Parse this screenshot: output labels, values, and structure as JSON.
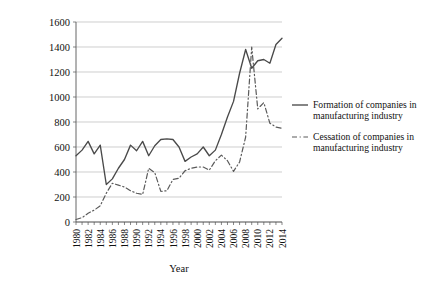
{
  "chart_data": {
    "type": "line",
    "title": "",
    "xlabel": "Year",
    "ylabel": "",
    "xlim": [
      1980,
      2014
    ],
    "ylim": [
      0,
      1600
    ],
    "ytick_step": 200,
    "xtick_step": 2,
    "grid": true,
    "legend_position": "right",
    "yticks": [
      0,
      200,
      400,
      600,
      800,
      1000,
      1200,
      1400,
      1600
    ],
    "xticks": [
      1980,
      1982,
      1984,
      1986,
      1988,
      1990,
      1992,
      1994,
      1996,
      1998,
      2000,
      2002,
      2004,
      2006,
      2008,
      2010,
      2012,
      2014
    ],
    "x": [
      1980,
      1981,
      1982,
      1983,
      1984,
      1985,
      1986,
      1987,
      1988,
      1989,
      1990,
      1991,
      1992,
      1993,
      1994,
      1995,
      1996,
      1997,
      1998,
      1999,
      2000,
      2001,
      2002,
      2003,
      2004,
      2005,
      2006,
      2007,
      2008,
      2009,
      2010,
      2011,
      2012,
      2013,
      2014
    ],
    "series": [
      {
        "name": "Formation of companies in manufacturing industry",
        "style": "solid",
        "color": "#4a4a4a",
        "values": [
          530,
          575,
          645,
          545,
          615,
          300,
          345,
          430,
          500,
          615,
          570,
          645,
          530,
          610,
          660,
          665,
          660,
          600,
          485,
          520,
          545,
          600,
          530,
          575,
          700,
          840,
          965,
          1190,
          1380,
          1230,
          1290,
          1300,
          1270,
          1420,
          1470
        ]
      },
      {
        "name": "Cessation of companies in manufacturing industry",
        "style": "dashed",
        "color": "#5a5a5a",
        "values": [
          20,
          35,
          70,
          95,
          130,
          230,
          310,
          295,
          280,
          250,
          230,
          220,
          430,
          395,
          245,
          250,
          340,
          350,
          410,
          430,
          440,
          440,
          415,
          490,
          535,
          490,
          405,
          480,
          680,
          1400,
          905,
          955,
          790,
          760,
          750
        ]
      }
    ],
    "annotations": []
  },
  "legend": {
    "items": [
      {
        "label_line1": "Formation of companies in",
        "label_line2": "manufacturing industry",
        "style": "solid"
      },
      {
        "label_line1": "Cessation of companies in",
        "label_line2": "manufacturing industry",
        "style": "dashed"
      }
    ]
  },
  "axis": {
    "x_title": "Year"
  }
}
